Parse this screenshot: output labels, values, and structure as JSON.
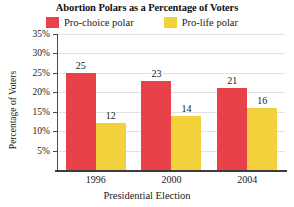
{
  "chart_data": {
    "type": "bar",
    "title": "Abortion Polars as a Percentage of Voters",
    "xlabel": "Presidential Election",
    "ylabel": "Percentage of Voters",
    "categories": [
      "1996",
      "2000",
      "2004"
    ],
    "series": [
      {
        "name": "Pro-choice polar",
        "values": [
          25,
          23,
          21
        ],
        "color": "#E8414A"
      },
      {
        "name": "Pro-life polar",
        "values": [
          12,
          14,
          16
        ],
        "color": "#F2D13C"
      }
    ],
    "ylim": [
      0,
      35
    ],
    "ytick_labels": [
      "5%",
      "10%",
      "15%",
      "20%",
      "25%",
      "30%",
      "35%"
    ],
    "ytick_values": [
      5,
      10,
      15,
      20,
      25,
      30,
      35
    ],
    "grid": true,
    "legend_position": "top",
    "data_labels": true
  }
}
